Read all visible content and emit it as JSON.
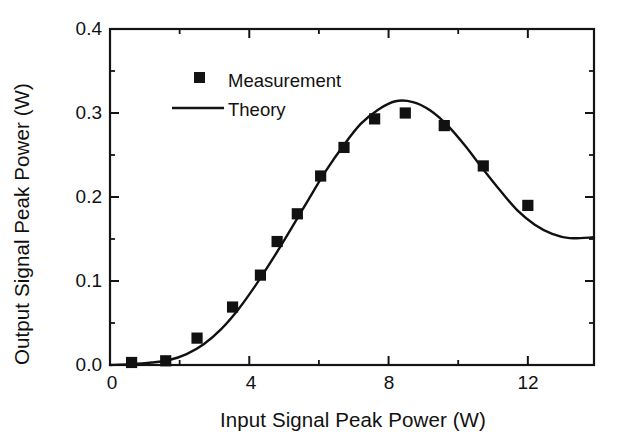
{
  "chart_data": {
    "type": "scatter",
    "title": "",
    "xlabel": "Input Signal Peak Power (W)",
    "ylabel": "Output Signal Peak Power (W)",
    "xlim": [
      0,
      13.9
    ],
    "ylim": [
      0.0,
      0.4
    ],
    "grid": false,
    "legend_position": "upper-left-inside",
    "x_ticks_major": [
      0,
      4,
      8,
      12
    ],
    "x_tick_labels": [
      "0",
      "4",
      "8",
      "12"
    ],
    "x_ticks_minor": [
      2,
      6,
      10
    ],
    "y_ticks_major": [
      0.0,
      0.1,
      0.2,
      0.3,
      0.4
    ],
    "y_tick_labels": [
      "0.0",
      "0.1",
      "0.2",
      "0.3",
      "0.4"
    ],
    "y_ticks_minor": [
      0.05,
      0.15,
      0.25,
      0.35
    ],
    "series": [
      {
        "name": "Measurement",
        "type": "scatter",
        "marker": "square",
        "color": "#111111",
        "points": [
          {
            "x": 0.62,
            "y": 0.003
          },
          {
            "x": 1.6,
            "y": 0.005
          },
          {
            "x": 2.5,
            "y": 0.032
          },
          {
            "x": 3.52,
            "y": 0.069
          },
          {
            "x": 4.32,
            "y": 0.107
          },
          {
            "x": 4.8,
            "y": 0.147
          },
          {
            "x": 5.38,
            "y": 0.18
          },
          {
            "x": 6.05,
            "y": 0.225
          },
          {
            "x": 6.72,
            "y": 0.259
          },
          {
            "x": 7.6,
            "y": 0.293
          },
          {
            "x": 8.48,
            "y": 0.3
          },
          {
            "x": 9.6,
            "y": 0.285
          },
          {
            "x": 10.72,
            "y": 0.237
          },
          {
            "x": 12.0,
            "y": 0.19
          }
        ]
      },
      {
        "name": "Theory",
        "type": "line",
        "color": "#111111",
        "points": [
          {
            "x": 0.0,
            "y": 0.0
          },
          {
            "x": 0.6,
            "y": 0.001
          },
          {
            "x": 1.2,
            "y": 0.003
          },
          {
            "x": 1.7,
            "y": 0.006
          },
          {
            "x": 2.2,
            "y": 0.013
          },
          {
            "x": 2.7,
            "y": 0.025
          },
          {
            "x": 3.2,
            "y": 0.043
          },
          {
            "x": 3.7,
            "y": 0.067
          },
          {
            "x": 4.2,
            "y": 0.096
          },
          {
            "x": 4.7,
            "y": 0.128
          },
          {
            "x": 5.2,
            "y": 0.162
          },
          {
            "x": 5.7,
            "y": 0.197
          },
          {
            "x": 6.2,
            "y": 0.231
          },
          {
            "x": 6.7,
            "y": 0.261
          },
          {
            "x": 7.2,
            "y": 0.287
          },
          {
            "x": 7.7,
            "y": 0.304
          },
          {
            "x": 8.2,
            "y": 0.314
          },
          {
            "x": 8.7,
            "y": 0.313
          },
          {
            "x": 9.2,
            "y": 0.303
          },
          {
            "x": 9.7,
            "y": 0.285
          },
          {
            "x": 10.2,
            "y": 0.261
          },
          {
            "x": 10.7,
            "y": 0.234
          },
          {
            "x": 11.2,
            "y": 0.208
          },
          {
            "x": 11.7,
            "y": 0.184
          },
          {
            "x": 12.2,
            "y": 0.167
          },
          {
            "x": 12.7,
            "y": 0.156
          },
          {
            "x": 13.2,
            "y": 0.151
          },
          {
            "x": 13.9,
            "y": 0.152
          }
        ]
      }
    ],
    "legend": [
      {
        "label": "Measurement",
        "marker": "square"
      },
      {
        "label": "Theory",
        "marker": "line"
      }
    ]
  }
}
